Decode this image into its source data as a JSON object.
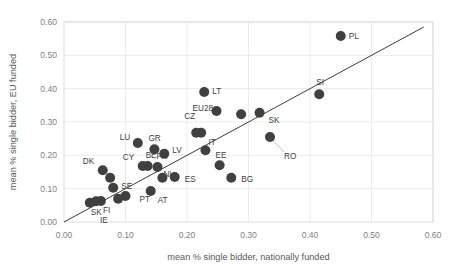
{
  "chart_data": {
    "type": "scatter",
    "title": "",
    "xlabel": "mean % single bidder, nationally funded",
    "ylabel": "mean % single bidder, EU funded",
    "xlim": [
      0.0,
      0.6
    ],
    "ylim": [
      0.0,
      0.6
    ],
    "xticks": [
      "0.00",
      "0.10",
      "0.20",
      "0.30",
      "0.40",
      "0.50",
      "0.60"
    ],
    "yticks": [
      "0.00",
      "0.10",
      "0.20",
      "0.30",
      "0.40",
      "0.50",
      "0.60"
    ],
    "xtick_values": [
      0.0,
      0.1,
      0.2,
      0.3,
      0.4,
      0.5,
      0.6
    ],
    "ytick_values": [
      0.0,
      0.1,
      0.2,
      0.3,
      0.4,
      0.5,
      0.6
    ],
    "grid": "horizontal-and-vertical",
    "legend": "none",
    "marker_color": "#404040",
    "marker_size": 5.0,
    "reference_line": {
      "name": "45-degree identity line",
      "from": [
        0.0,
        0.0
      ],
      "to": [
        0.585,
        0.585
      ],
      "color": "#262626"
    },
    "points": [
      {
        "label": "SK",
        "x": 0.042,
        "y": 0.058,
        "label_dx": 1,
        "label_dy": 12
      },
      {
        "label": "FI",
        "x": 0.052,
        "y": 0.062,
        "label_dx": 7,
        "label_dy": 12
      },
      {
        "label": "IE",
        "x": 0.06,
        "y": 0.063,
        "label_dx": -1,
        "label_dy": 22
      },
      {
        "label": "DK",
        "x": 0.063,
        "y": 0.155,
        "label_dx": -20,
        "label_dy": -6
      },
      {
        "label": "",
        "x": 0.075,
        "y": 0.133,
        "label_dx": 0,
        "label_dy": 0
      },
      {
        "label": "SE",
        "x": 0.08,
        "y": 0.103,
        "label_dx": 8,
        "label_dy": 1
      },
      {
        "label": "",
        "x": 0.088,
        "y": 0.07,
        "label_dx": 0,
        "label_dy": 0
      },
      {
        "label": "PT",
        "x": 0.1,
        "y": 0.078,
        "label_dx": 14,
        "label_dy": 6
      },
      {
        "label": "LU",
        "x": 0.12,
        "y": 0.237,
        "label_dx": -18,
        "label_dy": -3
      },
      {
        "label": "CY",
        "x": 0.128,
        "y": 0.168,
        "label_dx": -20,
        "label_dy": -6
      },
      {
        "label": "BE",
        "x": 0.136,
        "y": 0.168,
        "label_dx": -2,
        "label_dy": -8
      },
      {
        "label": "AT",
        "x": 0.141,
        "y": 0.093,
        "label_dx": 7,
        "label_dy": 12
      },
      {
        "label": "GR",
        "x": 0.147,
        "y": 0.218,
        "label_dx": -6,
        "label_dy": -8
      },
      {
        "label": "FR",
        "x": 0.152,
        "y": 0.165,
        "label_dx": -1,
        "label_dy": -8
      },
      {
        "label": "LV",
        "x": 0.163,
        "y": 0.205,
        "label_dx": 8,
        "label_dy": -1
      },
      {
        "label": "NL",
        "x": 0.16,
        "y": 0.133,
        "label_dx": 1,
        "label_dy": -1
      },
      {
        "label": "ES",
        "x": 0.18,
        "y": 0.135,
        "label_dx": 10,
        "label_dy": 5
      },
      {
        "label": "CZ",
        "x": 0.215,
        "y": 0.268,
        "label_dx": -12,
        "label_dy": -14
      },
      {
        "label": "",
        "x": 0.223,
        "y": 0.268,
        "label_dx": 0,
        "label_dy": 0
      },
      {
        "label": "LT",
        "x": 0.228,
        "y": 0.39,
        "label_dx": 8,
        "label_dy": 2
      },
      {
        "label": "IT",
        "x": 0.23,
        "y": 0.215,
        "label_dx": 3,
        "label_dy": -5
      },
      {
        "label": "EU28",
        "x": 0.248,
        "y": 0.333,
        "label_dx": -24,
        "label_dy": 0
      },
      {
        "label": "EE",
        "x": 0.253,
        "y": 0.17,
        "label_dx": -4,
        "label_dy": -7
      },
      {
        "label": "BG",
        "x": 0.272,
        "y": 0.133,
        "label_dx": 10,
        "label_dy": 4
      },
      {
        "label": "",
        "x": 0.288,
        "y": 0.323,
        "label_dx": 0,
        "label_dy": 0
      },
      {
        "label": "SK",
        "x": 0.318,
        "y": 0.328,
        "label_dx": 9,
        "label_dy": 10
      },
      {
        "label": "RO",
        "x": 0.335,
        "y": 0.255,
        "label_dx": 14,
        "label_dy": 22,
        "leader": true
      },
      {
        "label": "SI",
        "x": 0.415,
        "y": 0.383,
        "label_dx": -3,
        "label_dy": -9
      },
      {
        "label": "PL",
        "x": 0.45,
        "y": 0.558,
        "label_dx": 8,
        "label_dy": 3
      }
    ]
  }
}
